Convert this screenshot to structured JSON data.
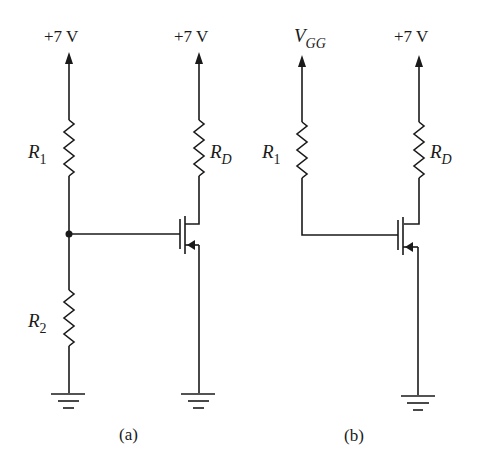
{
  "figure": {
    "circuit_a": {
      "caption": "(a)",
      "supply_left": "+7 V",
      "supply_right": "+7 V",
      "resistors": [
        {
          "name": "R",
          "sub": "1"
        },
        {
          "name": "R",
          "sub": "2"
        },
        {
          "name": "R",
          "sub": "D"
        }
      ],
      "components": [
        "R1",
        "R2",
        "RD",
        "n-channel MOSFET",
        "ground",
        "ground"
      ]
    },
    "circuit_b": {
      "caption": "(b)",
      "supply_left_main": "V",
      "supply_left_sub": "GG",
      "supply_right": "+7 V",
      "resistors": [
        {
          "name": "R",
          "sub": "1"
        },
        {
          "name": "R",
          "sub": "D"
        }
      ],
      "components": [
        "R1",
        "RD",
        "n-channel MOSFET",
        "ground"
      ]
    },
    "colors": {
      "ink": "#1a1a1a",
      "background": "#ffffff"
    }
  }
}
